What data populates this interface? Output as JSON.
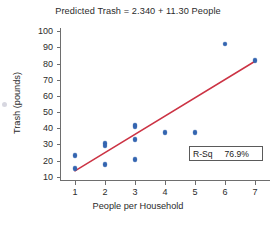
{
  "chart_data": {
    "type": "scatter",
    "title": "Predicted Trash = 2.340 + 11.30 People",
    "xlabel": "People per Household",
    "ylabel": "Trash (pounds)",
    "xlim": [
      0.5,
      7.5
    ],
    "ylim": [
      8,
      102
    ],
    "xticks": [
      1,
      2,
      3,
      4,
      5,
      6,
      7
    ],
    "xtick_labels": [
      "1",
      "2",
      "3",
      "4",
      "5",
      "6",
      "7"
    ],
    "yticks": [
      10,
      20,
      30,
      40,
      50,
      60,
      70,
      80,
      90,
      100
    ],
    "ytick_labels": [
      "10",
      "20",
      "30",
      "40",
      "50",
      "60",
      "70",
      "80",
      "90",
      "100"
    ],
    "grid": false,
    "legend_position": "inside-lower-right",
    "points": [
      {
        "x": 1,
        "y": 23
      },
      {
        "x": 1,
        "y": 15
      },
      {
        "x": 2,
        "y": 30.5
      },
      {
        "x": 2,
        "y": 29
      },
      {
        "x": 2,
        "y": 17.5
      },
      {
        "x": 3,
        "y": 42
      },
      {
        "x": 3,
        "y": 41
      },
      {
        "x": 3,
        "y": 33
      },
      {
        "x": 3,
        "y": 20.5
      },
      {
        "x": 4,
        "y": 37.5
      },
      {
        "x": 5,
        "y": 37.5
      },
      {
        "x": 6,
        "y": 92
      },
      {
        "x": 7,
        "y": 82
      }
    ],
    "fit_line": {
      "intercept": 2.34,
      "slope": 11.3,
      "x_start": 1,
      "x_end": 7,
      "y_start": 13.64,
      "y_end": 81.44,
      "color": "#cc3344"
    },
    "annotation": {
      "label": "R-Sq",
      "value": "76.9%"
    },
    "marker_color": "#3465b0",
    "axis_color": "#6e6e6e"
  }
}
